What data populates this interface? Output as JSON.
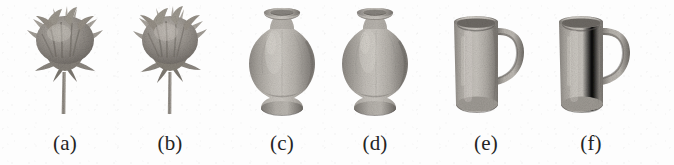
{
  "figure": {
    "background_color": "#fdfdfd",
    "ink_color": "#242424",
    "panel_count": 6,
    "panels": [
      {
        "id": "a",
        "caption": "(a)",
        "object_name": "flower",
        "object_icon": "flower-3d-model-icon",
        "center_x": 65,
        "view": "front"
      },
      {
        "id": "b",
        "caption": "(b)",
        "object_name": "flower",
        "object_icon": "flower-3d-model-icon",
        "center_x": 170,
        "view": "rotated"
      },
      {
        "id": "c",
        "caption": "(c)",
        "object_name": "vase",
        "object_icon": "vase-3d-model-icon",
        "center_x": 282,
        "view": "front"
      },
      {
        "id": "d",
        "caption": "(d)",
        "object_name": "vase",
        "object_icon": "vase-3d-model-icon",
        "center_x": 375,
        "view": "rotated"
      },
      {
        "id": "e",
        "caption": "(e)",
        "object_name": "mug",
        "object_icon": "mug-3d-model-icon",
        "center_x": 485,
        "view": "front"
      },
      {
        "id": "f",
        "caption": "(f)",
        "object_name": "mug",
        "object_icon": "mug-3d-model-icon",
        "center_x": 590,
        "view": "rotated"
      }
    ]
  }
}
